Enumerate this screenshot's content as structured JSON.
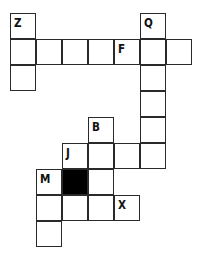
{
  "puzzle": {
    "type": "crossword-grid",
    "cell_size": 26,
    "origin": {
      "x": 10,
      "y": 13
    },
    "colors": {
      "border": "#2a2a2a",
      "fill": "#ffffff",
      "block": "#000000",
      "text": "#111111"
    },
    "cells": [
      {
        "row": 0,
        "col": 0,
        "letter": "Z"
      },
      {
        "row": 0,
        "col": 5,
        "letter": "Q"
      },
      {
        "row": 1,
        "col": 0,
        "letter": ""
      },
      {
        "row": 1,
        "col": 1,
        "letter": ""
      },
      {
        "row": 1,
        "col": 2,
        "letter": ""
      },
      {
        "row": 1,
        "col": 3,
        "letter": ""
      },
      {
        "row": 1,
        "col": 4,
        "letter": "F"
      },
      {
        "row": 1,
        "col": 5,
        "letter": ""
      },
      {
        "row": 1,
        "col": 6,
        "letter": ""
      },
      {
        "row": 2,
        "col": 0,
        "letter": ""
      },
      {
        "row": 2,
        "col": 5,
        "letter": ""
      },
      {
        "row": 3,
        "col": 5,
        "letter": ""
      },
      {
        "row": 4,
        "col": 3,
        "letter": "B"
      },
      {
        "row": 4,
        "col": 5,
        "letter": ""
      },
      {
        "row": 5,
        "col": 2,
        "letter": "J"
      },
      {
        "row": 5,
        "col": 3,
        "letter": ""
      },
      {
        "row": 5,
        "col": 4,
        "letter": ""
      },
      {
        "row": 5,
        "col": 5,
        "letter": ""
      },
      {
        "row": 6,
        "col": 1,
        "letter": "M"
      },
      {
        "row": 6,
        "col": 2,
        "letter": "",
        "black": true
      },
      {
        "row": 6,
        "col": 3,
        "letter": ""
      },
      {
        "row": 7,
        "col": 1,
        "letter": ""
      },
      {
        "row": 7,
        "col": 2,
        "letter": ""
      },
      {
        "row": 7,
        "col": 3,
        "letter": ""
      },
      {
        "row": 7,
        "col": 4,
        "letter": "X"
      },
      {
        "row": 8,
        "col": 1,
        "letter": ""
      }
    ]
  }
}
